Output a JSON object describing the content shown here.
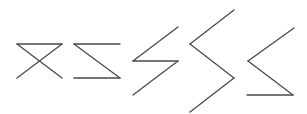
{
  "figure": {
    "background": "#ffffff",
    "stroke_color": "#4a4a4a",
    "stroke_width": 1.3,
    "shapes": [
      {
        "name": "hourglass-shape",
        "description": "Two crossing diagonals joined by a top bar",
        "segments": [
          [
            [
              17,
              44
            ],
            [
              62,
              44
            ]
          ],
          [
            [
              17,
              44
            ],
            [
              62,
              78
            ]
          ],
          [
            [
              62,
              44
            ],
            [
              17,
              78
            ]
          ]
        ]
      },
      {
        "name": "z-shape",
        "description": "Top bar, diagonal, bottom bar",
        "segments": [
          [
            [
              74,
              44
            ],
            [
              120,
              44
            ]
          ],
          [
            [
              74,
              44
            ],
            [
              120,
              78
            ]
          ],
          [
            [
              74,
              78
            ],
            [
              120,
              78
            ]
          ]
        ]
      },
      {
        "name": "lightning-shape",
        "description": "Diagonal, horizontal bar, diagonal",
        "segments": [
          [
            [
              178,
              27
            ],
            [
              133,
              61
            ]
          ],
          [
            [
              133,
              61
            ],
            [
              178,
              61
            ]
          ],
          [
            [
              178,
              61
            ],
            [
              133,
              95
            ]
          ]
        ]
      },
      {
        "name": "zigzag-shape",
        "description": "Three connected diagonals",
        "segments": [
          [
            [
              234,
              10
            ],
            [
              190,
              44
            ]
          ],
          [
            [
              190,
              44
            ],
            [
              234,
              78
            ]
          ],
          [
            [
              234,
              78
            ],
            [
              190,
              112
            ]
          ]
        ]
      },
      {
        "name": "angle-with-base-shape",
        "description": "Less-than chevron with a bottom bar",
        "segments": [
          [
            [
              294,
              28
            ],
            [
              248,
              61
            ]
          ],
          [
            [
              248,
              61
            ],
            [
              293,
              95
            ]
          ],
          [
            [
              247,
              95
            ],
            [
              293,
              95
            ]
          ]
        ]
      }
    ]
  }
}
